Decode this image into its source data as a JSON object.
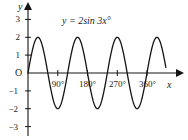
{
  "chart_data": {
    "type": "line",
    "title": "",
    "annotation": "y = 2sin 3x°",
    "equation": "y = 2sin 3x°",
    "amplitude": 2,
    "frequency_multiplier": 3,
    "period_degrees": 120,
    "xlabel": "x",
    "ylabel": "y",
    "origin_label": "O",
    "xlim": [
      0,
      400
    ],
    "ylim": [
      -3.4,
      3.4
    ],
    "grid": false,
    "legend": "none",
    "x_ticks": [
      {
        "value": 90,
        "label": "90°"
      },
      {
        "value": 180,
        "label": "180°"
      },
      {
        "value": 270,
        "label": "270°"
      },
      {
        "value": 360,
        "label": "360°"
      }
    ],
    "y_ticks": [
      {
        "value": 3,
        "label": "3"
      },
      {
        "value": 2,
        "label": "2"
      },
      {
        "value": 1,
        "label": "1"
      },
      {
        "value": -1,
        "label": "−1"
      },
      {
        "value": -2,
        "label": "−2"
      },
      {
        "value": -3,
        "label": "−3"
      }
    ],
    "series": [
      {
        "name": "y = 2sin 3x°",
        "color": "#141414",
        "x": [
          0,
          10,
          20,
          30,
          40,
          50,
          60,
          70,
          80,
          90,
          100,
          110,
          120,
          130,
          140,
          150,
          160,
          170,
          180,
          190,
          200,
          210,
          220,
          230,
          240,
          250,
          260,
          270,
          280,
          290,
          300,
          310,
          320,
          330,
          340,
          350,
          360,
          370,
          380
        ],
        "values": [
          0,
          1.0,
          1.73,
          2.0,
          1.73,
          1.0,
          0,
          -1.0,
          -1.73,
          -2.0,
          -1.73,
          -1.0,
          0,
          1.0,
          1.73,
          2.0,
          1.73,
          1.0,
          0,
          -1.0,
          -1.73,
          -2.0,
          -1.73,
          -1.0,
          0,
          1.0,
          1.73,
          2.0,
          1.73,
          1.0,
          0,
          -1.0,
          -1.73,
          -2.0,
          -1.73,
          -1.0,
          0,
          1.0,
          1.73
        ]
      }
    ],
    "maxima": [
      {
        "x": 30,
        "y": 2
      },
      {
        "x": 150,
        "y": 2
      },
      {
        "x": 270,
        "y": 2
      }
    ],
    "minima": [
      {
        "x": 90,
        "y": -2
      },
      {
        "x": 210,
        "y": -2
      },
      {
        "x": 330,
        "y": -2
      }
    ],
    "zero_crossings": [
      0,
      60,
      120,
      180,
      240,
      300,
      360
    ],
    "axis_color": "#141414",
    "curve_color": "#141414",
    "text_color": "#1a1a1a",
    "background": "#ffffff"
  }
}
